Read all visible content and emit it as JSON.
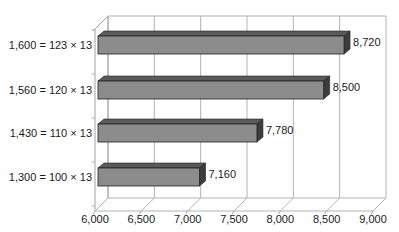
{
  "chart_data": {
    "type": "bar",
    "orientation": "horizontal",
    "style": "3d",
    "title": "",
    "xlabel": "",
    "ylabel": "",
    "categories": [
      "1,600 = 123 × 13",
      "1,560 = 120 × 13",
      "1,430 = 110 × 13",
      "1,300 = 100 × 13"
    ],
    "values": [
      8720,
      8500,
      7780,
      7160
    ],
    "value_labels": [
      "8,720",
      "8,500",
      "7,780",
      "7,160"
    ],
    "xlim": [
      6000,
      9000
    ],
    "x_ticks": [
      6000,
      6500,
      7000,
      7500,
      8000,
      8500,
      9000
    ],
    "x_tick_labels": [
      "6,000",
      "6,500",
      "7,000",
      "7,500",
      "8,000",
      "8,500",
      "9,000"
    ],
    "grid": true,
    "legend": null,
    "colors": {
      "bar_front": "#8c8c8c",
      "bar_top": "#5a5a5a",
      "bar_side": "#3c3c3c",
      "grid": "#b4b4b4",
      "axis": "#a0a0a0"
    }
  }
}
